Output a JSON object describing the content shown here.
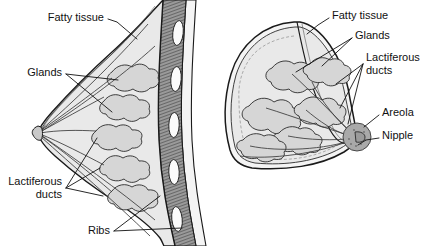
{
  "figure": {
    "background_color": "#ffffff",
    "ink_color": "#111111",
    "colors": {
      "skin_fill": "#f2f2f2",
      "fat_fill": "#e9e9e9",
      "gland_fill": "#d6d6d6",
      "muscle_fill": "#8f8f8f",
      "rib_fill": "#fbfbfb",
      "areola_fill": "#a9a9a9",
      "duct_stroke": "#3a3a3a"
    }
  },
  "left_view": {
    "name": "lateral-sagittal-section",
    "labels": [
      {
        "id": "fatty-tissue",
        "text": "Fatty tissue",
        "x": 104,
        "y": 18,
        "align": "end"
      },
      {
        "id": "glands",
        "text": "Glands",
        "x": 62,
        "y": 73,
        "align": "end"
      },
      {
        "id": "lactiferous",
        "line1": "Lactiferous",
        "line2": "ducts",
        "x": 62,
        "y": 188,
        "align": "end"
      },
      {
        "id": "ribs",
        "text": "Ribs",
        "x": 110,
        "y": 231,
        "align": "end"
      }
    ],
    "structure": {
      "gland_count": 5,
      "rib_count": 5,
      "duct_count": 7,
      "nipple_x": 38,
      "nipple_y": 133
    }
  },
  "right_view": {
    "name": "oblique-anterior-section",
    "labels": [
      {
        "id": "fatty-tissue",
        "text": "Fatty tissue",
        "x": 332,
        "y": 16,
        "align": "start"
      },
      {
        "id": "glands",
        "text": "Glands",
        "x": 355,
        "y": 36,
        "align": "start"
      },
      {
        "id": "lactiferous",
        "line1": "Lactiferous",
        "line2": "ducts",
        "x": 366,
        "y": 64,
        "align": "start"
      },
      {
        "id": "areola",
        "text": "Areola",
        "x": 382,
        "y": 113,
        "align": "start"
      },
      {
        "id": "nipple",
        "text": "Nipple",
        "x": 382,
        "y": 136,
        "align": "start"
      }
    ],
    "structure": {
      "gland_count": 6,
      "duct_count": 6,
      "nipple_x": 357,
      "nipple_y": 137,
      "areola_radius": 14
    }
  }
}
